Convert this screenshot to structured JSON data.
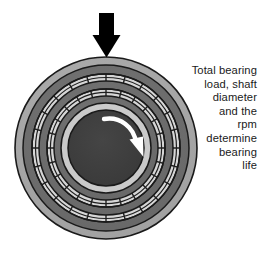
{
  "diagram": {
    "caption_lines": [
      "Total bearing",
      "load, shaft",
      "diameter",
      "and the",
      "rpm",
      "determine",
      "bearing",
      "life"
    ],
    "caption_text": "Total bearing load, shaft diameter and the rpm determine bearing life",
    "load_arrow": {
      "name": "load-arrow",
      "direction": "down",
      "color": "#000000"
    },
    "rotation_arrow": {
      "name": "rotation-arrow",
      "direction": "clockwise",
      "color": "#ffffff"
    },
    "center": {
      "cx": 106,
      "cy": 148
    },
    "rings": [
      {
        "label": "outer-race-outer",
        "radius": 91,
        "fill": "#a8a8a8",
        "stroke": "#1a1a1a"
      },
      {
        "label": "outer-race-inner",
        "radius": 83,
        "fill": "#6e6e6e",
        "stroke": "#1a1a1a"
      },
      {
        "label": "outer-cage-band",
        "radius": 74,
        "fill": "#d4d4d4",
        "stroke": "#1a1a1a",
        "hatched": true
      },
      {
        "label": "mid-race-outer",
        "radius": 67,
        "fill": "#6e6e6e",
        "stroke": "#1a1a1a"
      },
      {
        "label": "inner-cage-band",
        "radius": 59,
        "fill": "#d4d4d4",
        "stroke": "#1a1a1a",
        "hatched": true
      },
      {
        "label": "inner-race",
        "radius": 52,
        "fill": "#6e6e6e",
        "stroke": "#1a1a1a"
      },
      {
        "label": "shaft-collar",
        "radius": 45,
        "fill": "#c9c9c9",
        "stroke": "#1a1a1a"
      },
      {
        "label": "shaft-hub",
        "radius": 38,
        "fill": "#3d3d3d",
        "stroke": "#1a1a1a"
      }
    ],
    "colors": {
      "outer_light": "#a8a8a8",
      "ring_dark": "#6e6e6e",
      "cage_light": "#d4d4d4",
      "collar_light": "#c9c9c9",
      "hub_dark": "#3d3d3d",
      "outline": "#1a1a1a",
      "text": "#1a1a1a",
      "background": "#ffffff"
    }
  }
}
